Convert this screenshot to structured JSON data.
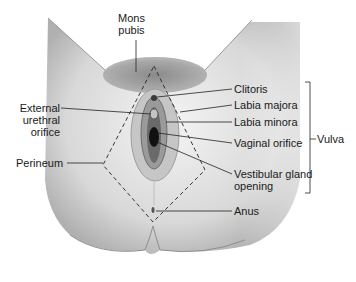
{
  "diagram": {
    "labels": {
      "mons_pubis": [
        "Mons",
        "pubis"
      ],
      "external_urethral_orifice": [
        "External",
        "urethral",
        "orifice"
      ],
      "perineum": "Perineum",
      "clitoris": "Clitoris",
      "labia_majora": "Labia majora",
      "labia_minora": "Labia minora",
      "vaginal_orifice": "Vaginal orifice",
      "vestibular_gland_opening": [
        "Vestibular gland",
        "opening"
      ],
      "anus": "Anus",
      "vulva": "Vulva"
    },
    "colors": {
      "skin_light": "#f2f2f2",
      "skin_mid": "#cfcfcf",
      "skin_dark": "#8a8a8a",
      "hair": "#6e6e6e",
      "line": "#222222"
    }
  }
}
